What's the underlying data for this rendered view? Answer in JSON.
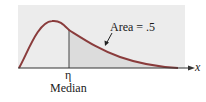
{
  "diagram": {
    "type": "right-skewed density curve with median",
    "area_label": "Area = .5",
    "median_symbol": "η",
    "median_caption": "Median",
    "axis_label": "x",
    "colors": {
      "background_panel": "#ececec",
      "shaded_region": "#dcdcdc",
      "curve": "#8a3c3c",
      "axis": "#333333",
      "text": "#1a1a1a"
    }
  }
}
